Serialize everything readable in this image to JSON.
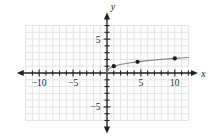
{
  "figure": {
    "background_color": "#ffffff",
    "width": 220,
    "height": 136
  },
  "chart_data": {
    "type": "line",
    "title": "",
    "subtitle": "",
    "xlabel": "x",
    "ylabel": "y",
    "xlim": [
      -12.2,
      14.5
    ],
    "ylim": [
      -8.0,
      8.4
    ],
    "grid": true,
    "grid_color": "#e4e4e6",
    "grid_step": 1,
    "legend": "none",
    "axis_color": "#231f20",
    "curve_color": "#808285",
    "point_color": "#231f20",
    "x_tick_labels": [
      {
        "value": -10,
        "text": "-10"
      },
      {
        "value": -5,
        "text": "-5"
      },
      {
        "value": 5,
        "text": "5"
      },
      {
        "value": 10,
        "text": "10"
      }
    ],
    "y_tick_labels": [
      {
        "value": 5,
        "text": "5"
      },
      {
        "value": -5,
        "text": "-5"
      }
    ],
    "x_minor_ticks": [
      -11,
      -10,
      -9,
      -8,
      -7,
      -6,
      -5,
      -4,
      -3,
      -2,
      -1,
      1,
      2,
      3,
      4,
      5,
      6,
      7,
      8,
      9,
      10,
      11,
      12
    ],
    "y_minor_ticks": [
      -7,
      -6,
      -5,
      -4,
      -3,
      -2,
      -1,
      1,
      2,
      3,
      4,
      5,
      6,
      7
    ],
    "series": [
      {
        "name": "curve",
        "description": "increasing concave-down radical curve through the origin",
        "x": [
          0,
          0.25,
          0.5,
          1,
          1.5,
          2,
          3,
          4,
          5,
          6,
          7,
          8,
          9,
          10,
          11,
          12
        ],
        "y": [
          0,
          0.62,
          0.78,
          1.0,
          1.14,
          1.26,
          1.44,
          1.59,
          1.71,
          1.82,
          1.91,
          2.0,
          2.08,
          2.15,
          2.22,
          2.29
        ]
      }
    ],
    "points": [
      {
        "x": 1,
        "y": 1.0,
        "label": ""
      },
      {
        "x": 4.5,
        "y": 1.65,
        "label": ""
      },
      {
        "x": 10,
        "y": 2.15,
        "label": ""
      }
    ],
    "annotations": []
  },
  "icons": {
    "x_axis_left_arrow": "arrow-left-icon",
    "x_axis_right_arrow": "arrow-right-icon",
    "y_axis_up_arrow": "arrow-up-icon",
    "y_axis_down_arrow": "arrow-down-icon"
  }
}
